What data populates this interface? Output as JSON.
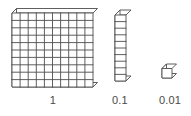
{
  "figure": {
    "background_color": "#ffffff",
    "line_color": "#4d4d4d",
    "face_color": "#ffffff",
    "label_color": "#4a4a4a"
  },
  "blocks": [
    {
      "name": "flat",
      "label": "1",
      "value": 1,
      "rows": 10,
      "cols": 10,
      "unit_count": 100,
      "description": "10 by 10 flat of small cubes"
    },
    {
      "name": "rod",
      "label": "0.1",
      "value": 0.1,
      "rows": 10,
      "cols": 1,
      "unit_count": 10,
      "description": "single column of 10 small cubes"
    },
    {
      "name": "unit",
      "label": "0.01",
      "value": 0.01,
      "rows": 1,
      "cols": 1,
      "unit_count": 1,
      "description": "single small cube"
    }
  ],
  "labels": {
    "one": "1",
    "tenth": "0.1",
    "hundredth": "0.01"
  }
}
